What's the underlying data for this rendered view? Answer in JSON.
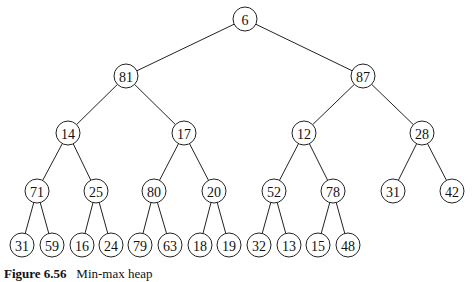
{
  "tree": {
    "nodes": [
      {
        "id": "n0",
        "label": "6",
        "x": 245,
        "y": 19
      },
      {
        "id": "n1",
        "label": "81",
        "x": 126,
        "y": 76
      },
      {
        "id": "n2",
        "label": "87",
        "x": 363,
        "y": 76
      },
      {
        "id": "n3",
        "label": "14",
        "x": 68,
        "y": 133
      },
      {
        "id": "n4",
        "label": "17",
        "x": 184,
        "y": 133
      },
      {
        "id": "n5",
        "label": "12",
        "x": 304,
        "y": 133
      },
      {
        "id": "n6",
        "label": "28",
        "x": 422,
        "y": 133
      },
      {
        "id": "n7",
        "label": "71",
        "x": 37,
        "y": 191
      },
      {
        "id": "n8",
        "label": "25",
        "x": 96,
        "y": 191
      },
      {
        "id": "n9",
        "label": "80",
        "x": 154,
        "y": 191
      },
      {
        "id": "n10",
        "label": "20",
        "x": 214,
        "y": 191
      },
      {
        "id": "n11",
        "label": "52",
        "x": 274,
        "y": 191
      },
      {
        "id": "n12",
        "label": "78",
        "x": 333,
        "y": 191
      },
      {
        "id": "n13",
        "label": "31",
        "x": 393,
        "y": 191
      },
      {
        "id": "n14",
        "label": "42",
        "x": 452,
        "y": 191
      },
      {
        "id": "n15",
        "label": "31",
        "x": 22,
        "y": 245
      },
      {
        "id": "n16",
        "label": "59",
        "x": 52,
        "y": 245
      },
      {
        "id": "n17",
        "label": "16",
        "x": 82,
        "y": 245
      },
      {
        "id": "n18",
        "label": "24",
        "x": 111,
        "y": 245
      },
      {
        "id": "n19",
        "label": "79",
        "x": 140,
        "y": 245
      },
      {
        "id": "n20",
        "label": "63",
        "x": 170,
        "y": 245
      },
      {
        "id": "n21",
        "label": "18",
        "x": 200,
        "y": 245
      },
      {
        "id": "n22",
        "label": "19",
        "x": 229,
        "y": 245
      },
      {
        "id": "n23",
        "label": "32",
        "x": 259,
        "y": 245
      },
      {
        "id": "n24",
        "label": "13",
        "x": 289,
        "y": 245
      },
      {
        "id": "n25",
        "label": "15",
        "x": 318,
        "y": 245
      },
      {
        "id": "n26",
        "label": "48",
        "x": 348,
        "y": 245
      }
    ],
    "edges": [
      [
        "n0",
        "n1"
      ],
      [
        "n0",
        "n2"
      ],
      [
        "n1",
        "n3"
      ],
      [
        "n1",
        "n4"
      ],
      [
        "n2",
        "n5"
      ],
      [
        "n2",
        "n6"
      ],
      [
        "n3",
        "n7"
      ],
      [
        "n3",
        "n8"
      ],
      [
        "n4",
        "n9"
      ],
      [
        "n4",
        "n10"
      ],
      [
        "n5",
        "n11"
      ],
      [
        "n5",
        "n12"
      ],
      [
        "n6",
        "n13"
      ],
      [
        "n6",
        "n14"
      ],
      [
        "n7",
        "n15"
      ],
      [
        "n7",
        "n16"
      ],
      [
        "n8",
        "n17"
      ],
      [
        "n8",
        "n18"
      ],
      [
        "n9",
        "n19"
      ],
      [
        "n9",
        "n20"
      ],
      [
        "n10",
        "n21"
      ],
      [
        "n10",
        "n22"
      ],
      [
        "n11",
        "n23"
      ],
      [
        "n11",
        "n24"
      ],
      [
        "n12",
        "n25"
      ],
      [
        "n12",
        "n26"
      ]
    ],
    "radius": 12
  },
  "caption": {
    "figure": "Figure 6.56",
    "text": "Min-max heap"
  }
}
